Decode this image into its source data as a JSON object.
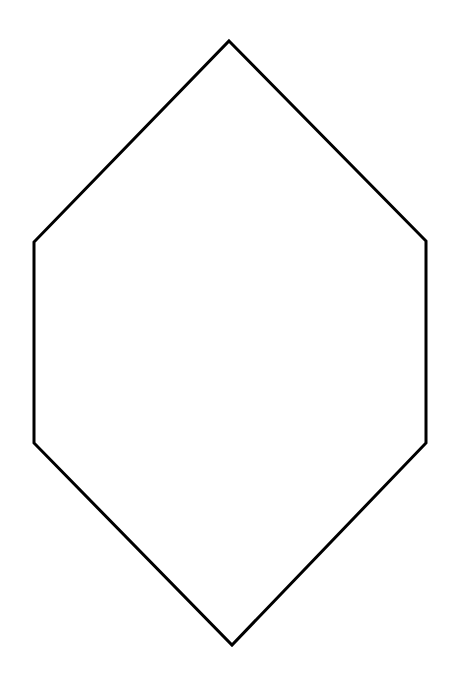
{
  "diagram": {
    "background": "#ffffff",
    "shapes": [
      {
        "type": "hexagon",
        "stroke": "#000000",
        "stroke_width": 3,
        "fill": "none",
        "points": [
          [
            229,
            41
          ],
          [
            426,
            241
          ],
          [
            426,
            443
          ],
          [
            232,
            645
          ],
          [
            34,
            443
          ],
          [
            34,
            242
          ]
        ]
      }
    ]
  }
}
